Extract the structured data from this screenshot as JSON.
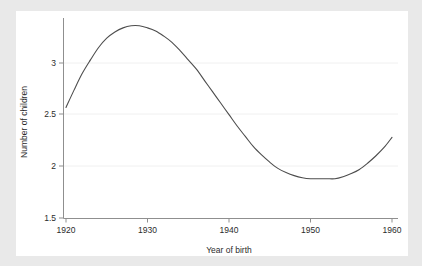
{
  "figure": {
    "background_color": "#e9e9e9",
    "panel_color": "#ffffff",
    "line_color": "#4d4d4d",
    "grid_color": "#f0f0f0",
    "axis_color": "#9a9a9a",
    "text_color": "#2b2b2b"
  },
  "chart_data": {
    "type": "line",
    "title": "",
    "subtitle": "",
    "xlabel": "Year of birth",
    "ylabel": "Number of children",
    "xlim": [
      1920,
      1960
    ],
    "ylim": [
      1.5,
      3.5
    ],
    "xticks": [
      1920,
      1930,
      1940,
      1950,
      1960
    ],
    "xtick_labels": [
      "1920",
      "1930",
      "1940",
      "1950",
      "1960"
    ],
    "yticks": [
      1.5,
      2,
      2.5,
      3
    ],
    "ytick_labels": [
      "1.5",
      "2",
      "2.5",
      "3"
    ],
    "grid": "horizontal",
    "legend": null,
    "legend_position": "none",
    "annotations": [],
    "series": [
      {
        "name": "Number of children",
        "x": [
          1920,
          1921,
          1922,
          1923,
          1924,
          1925,
          1926,
          1927,
          1928,
          1929,
          1930,
          1931,
          1932,
          1933,
          1934,
          1935,
          1936,
          1937,
          1938,
          1939,
          1940,
          1941,
          1942,
          1943,
          1944,
          1945,
          1946,
          1947,
          1948,
          1949,
          1950,
          1951,
          1952,
          1953,
          1954,
          1955,
          1956,
          1957,
          1958,
          1959,
          1960
        ],
        "values": [
          2.57,
          2.74,
          2.9,
          3.03,
          3.15,
          3.24,
          3.3,
          3.34,
          3.36,
          3.36,
          3.34,
          3.31,
          3.26,
          3.2,
          3.12,
          3.03,
          2.94,
          2.83,
          2.72,
          2.61,
          2.5,
          2.39,
          2.29,
          2.19,
          2.11,
          2.04,
          1.98,
          1.94,
          1.91,
          1.89,
          1.88,
          1.88,
          1.88,
          1.88,
          1.9,
          1.93,
          1.97,
          2.03,
          2.1,
          2.18,
          2.28
        ]
      }
    ]
  }
}
